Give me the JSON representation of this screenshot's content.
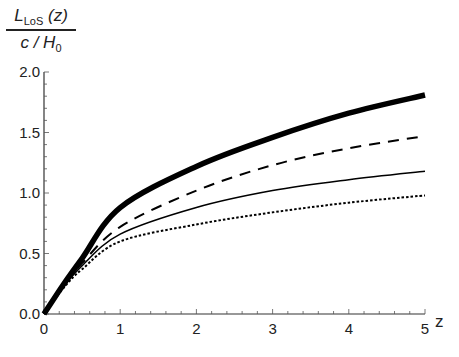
{
  "chart_data": {
    "type": "line",
    "title": "",
    "xlabel": "z",
    "ylabel": "L_LoS(z) / (c/H_0)",
    "ylabel_parts": {
      "num_main": "L",
      "num_sub": "LoS",
      "num_arg": " (z)",
      "den_main": "c / H",
      "den_sub": "0"
    },
    "xlim": [
      0,
      5
    ],
    "ylim": [
      0,
      2.0
    ],
    "xticks": [
      "0",
      "1",
      "2",
      "3",
      "4",
      "5"
    ],
    "yticks": [
      "0.0",
      "0.5",
      "1.0",
      "1.5",
      "2.0"
    ],
    "grid": false,
    "legend": null,
    "x": [
      0,
      0.25,
      0.5,
      1,
      2,
      3,
      4,
      5
    ],
    "series": [
      {
        "name": "thick solid",
        "style": "thick",
        "values": [
          0,
          0.24,
          0.46,
          0.88,
          1.22,
          1.46,
          1.66,
          1.81
        ]
      },
      {
        "name": "dashed",
        "style": "dashed",
        "values": [
          0,
          0.23,
          0.42,
          0.72,
          1.02,
          1.23,
          1.37,
          1.47
        ]
      },
      {
        "name": "thin solid",
        "style": "solid",
        "values": [
          0,
          0.22,
          0.4,
          0.66,
          0.88,
          1.02,
          1.11,
          1.18
        ]
      },
      {
        "name": "dotted",
        "style": "dotted",
        "values": [
          0,
          0.21,
          0.37,
          0.6,
          0.74,
          0.84,
          0.92,
          0.98
        ]
      }
    ]
  }
}
